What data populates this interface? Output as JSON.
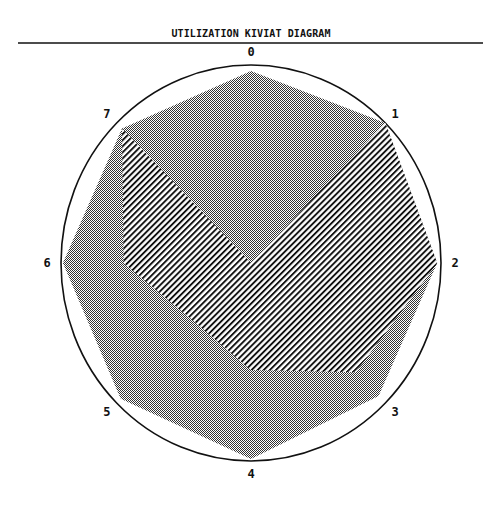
{
  "title": "UTILIZATION KIVIAT DIAGRAM",
  "colors": {
    "ink": "#111111",
    "stipple": "#333333",
    "paper": "#ffffff"
  },
  "chart_data": {
    "type": "radar",
    "title": "UTILIZATION KIVIAT DIAGRAM",
    "xlabel": "",
    "ylabel": "",
    "axes": [
      "0",
      "1",
      "2",
      "3",
      "4",
      "5",
      "6",
      "7"
    ],
    "range": [
      0,
      1
    ],
    "grid": false,
    "legend": null,
    "series": [
      {
        "name": "stippled",
        "pattern": "stipple",
        "values": [
          0.97,
          1.0,
          0.98,
          0.95,
          0.99,
          0.97,
          0.99,
          0.96
        ]
      },
      {
        "name": "hatched",
        "pattern": "diagonal-hatch",
        "values": [
          0.0,
          1.0,
          0.98,
          0.78,
          0.54,
          0.42,
          0.67,
          0.96
        ]
      }
    ]
  }
}
